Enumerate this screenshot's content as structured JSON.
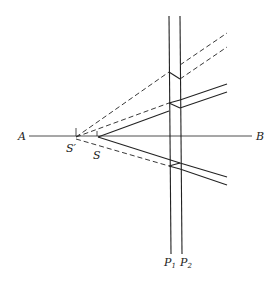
{
  "figure": {
    "labels": {
      "A": "A",
      "B": "B",
      "S": "S",
      "S_prime": "S′",
      "P1": "P",
      "P1_sub": "1",
      "P2": "P",
      "P2_sub": "2"
    }
  }
}
